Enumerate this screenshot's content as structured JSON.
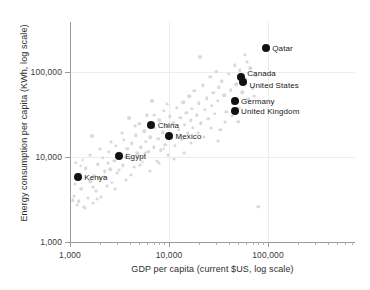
{
  "chart_data": {
    "type": "scatter",
    "title": "",
    "xlabel": "GDP per capita (current $US, log scale)",
    "ylabel": "Energy consumption per capita (KWh, log scale)",
    "xscale": "log",
    "yscale": "log",
    "xlim": [
      1000,
      400000
    ],
    "ylim": [
      1000,
      300000
    ],
    "grid": true,
    "legend": "none",
    "xticks": [
      {
        "value": 1000,
        "label": "1,000"
      },
      {
        "value": 10000,
        "label": "10,000"
      },
      {
        "value": 100000,
        "label": "100,000"
      }
    ],
    "yticks": [
      {
        "value": 1000,
        "label": "1,000"
      },
      {
        "value": 10000,
        "label": "10,000"
      },
      {
        "value": 100000,
        "label": "100,000"
      }
    ],
    "series": [
      {
        "name": "Highlighted countries",
        "color": "#111111",
        "points": [
          {
            "label": "Kenya",
            "x": 1200,
            "y": 5800,
            "label_pos": "right"
          },
          {
            "label": "Egypt",
            "x": 3100,
            "y": 10200,
            "label_pos": "right"
          },
          {
            "label": "China",
            "x": 6600,
            "y": 24000,
            "label_pos": "right"
          },
          {
            "label": "Mexico",
            "x": 10000,
            "y": 17500,
            "label_pos": "right"
          },
          {
            "label": "Canada",
            "x": 53000,
            "y": 88000,
            "label_pos": "right-stacked-top"
          },
          {
            "label": "United States",
            "x": 56000,
            "y": 76000,
            "label_pos": "right-stacked-bottom"
          },
          {
            "label": "Germany",
            "x": 46000,
            "y": 45000,
            "label_pos": "right"
          },
          {
            "label": "United Kingdom",
            "x": 46000,
            "y": 35000,
            "label_pos": "right"
          },
          {
            "label": "Qatar",
            "x": 95000,
            "y": 190000,
            "label_pos": "right"
          }
        ]
      },
      {
        "name": "Other countries",
        "color": "#d9d9d9",
        "points": [
          {
            "x": 1060,
            "y": 3100,
            "size": 3
          },
          {
            "x": 1090,
            "y": 3500,
            "size": 2.5
          },
          {
            "x": 1150,
            "y": 8600,
            "size": 3
          },
          {
            "x": 1180,
            "y": 2700,
            "size": 2.5
          },
          {
            "x": 1220,
            "y": 3000,
            "size": 3
          },
          {
            "x": 1260,
            "y": 6300,
            "size": 2.5
          },
          {
            "x": 1300,
            "y": 4200,
            "size": 3
          },
          {
            "x": 1340,
            "y": 9200,
            "size": 2.5
          },
          {
            "x": 1380,
            "y": 2600,
            "size": 3
          },
          {
            "x": 1450,
            "y": 7400,
            "size": 3
          },
          {
            "x": 1520,
            "y": 3300,
            "size": 2.5
          },
          {
            "x": 1600,
            "y": 5200,
            "size": 3
          },
          {
            "x": 1660,
            "y": 17500,
            "size": 3.5
          },
          {
            "x": 1700,
            "y": 2900,
            "size": 2.5
          },
          {
            "x": 1760,
            "y": 6000,
            "size": 3
          },
          {
            "x": 1820,
            "y": 4000,
            "size": 2.5
          },
          {
            "x": 1900,
            "y": 8200,
            "size": 3
          },
          {
            "x": 1980,
            "y": 5600,
            "size": 3
          },
          {
            "x": 2050,
            "y": 3400,
            "size": 2.5
          },
          {
            "x": 2150,
            "y": 9800,
            "size": 3
          },
          {
            "x": 2250,
            "y": 6800,
            "size": 3
          },
          {
            "x": 2350,
            "y": 4600,
            "size": 2.5
          },
          {
            "x": 2450,
            "y": 11500,
            "size": 3
          },
          {
            "x": 2550,
            "y": 7200,
            "size": 3
          },
          {
            "x": 2650,
            "y": 5000,
            "size": 2.5
          },
          {
            "x": 2800,
            "y": 9000,
            "size": 3
          },
          {
            "x": 2900,
            "y": 13500,
            "size": 3
          },
          {
            "x": 3000,
            "y": 6500,
            "size": 2.5
          },
          {
            "x": 3200,
            "y": 11000,
            "size": 3
          },
          {
            "x": 3400,
            "y": 8000,
            "size": 3
          },
          {
            "x": 3500,
            "y": 16000,
            "size": 3
          },
          {
            "x": 3650,
            "y": 5400,
            "size": 2.5
          },
          {
            "x": 3800,
            "y": 12500,
            "size": 3
          },
          {
            "x": 3900,
            "y": 29000,
            "size": 3.5
          },
          {
            "x": 4000,
            "y": 9500,
            "size": 3
          },
          {
            "x": 4200,
            "y": 14500,
            "size": 3
          },
          {
            "x": 4400,
            "y": 7600,
            "size": 2.5
          },
          {
            "x": 4600,
            "y": 18000,
            "size": 3
          },
          {
            "x": 4800,
            "y": 11000,
            "size": 3
          },
          {
            "x": 5000,
            "y": 24500,
            "size": 3
          },
          {
            "x": 5200,
            "y": 13000,
            "size": 3
          },
          {
            "x": 5400,
            "y": 8800,
            "size": 2.5
          },
          {
            "x": 5600,
            "y": 20000,
            "size": 3
          },
          {
            "x": 5800,
            "y": 15000,
            "size": 3
          },
          {
            "x": 6000,
            "y": 31000,
            "size": 3
          },
          {
            "x": 6200,
            "y": 11500,
            "size": 3
          },
          {
            "x": 6500,
            "y": 17000,
            "size": 3
          },
          {
            "x": 6800,
            "y": 45000,
            "size": 3.5
          },
          {
            "x": 7000,
            "y": 13000,
            "size": 3
          },
          {
            "x": 7200,
            "y": 22000,
            "size": 3
          },
          {
            "x": 7500,
            "y": 9000,
            "size": 2.5
          },
          {
            "x": 7800,
            "y": 16500,
            "size": 3
          },
          {
            "x": 8000,
            "y": 27000,
            "size": 3
          },
          {
            "x": 8300,
            "y": 12000,
            "size": 3
          },
          {
            "x": 8600,
            "y": 19500,
            "size": 3
          },
          {
            "x": 8900,
            "y": 35000,
            "size": 3
          },
          {
            "x": 9200,
            "y": 14000,
            "size": 3
          },
          {
            "x": 9500,
            "y": 23000,
            "size": 3
          },
          {
            "x": 9800,
            "y": 10500,
            "size": 2.5
          },
          {
            "x": 10200,
            "y": 30000,
            "size": 3
          },
          {
            "x": 10600,
            "y": 17000,
            "size": 3
          },
          {
            "x": 11000,
            "y": 25000,
            "size": 3
          },
          {
            "x": 11500,
            "y": 13500,
            "size": 3
          },
          {
            "x": 12000,
            "y": 38000,
            "size": 3
          },
          {
            "x": 12500,
            "y": 21000,
            "size": 3
          },
          {
            "x": 13000,
            "y": 29000,
            "size": 3
          },
          {
            "x": 13500,
            "y": 16000,
            "size": 3
          },
          {
            "x": 14000,
            "y": 44000,
            "size": 3
          },
          {
            "x": 14500,
            "y": 24000,
            "size": 3
          },
          {
            "x": 15000,
            "y": 33000,
            "size": 3
          },
          {
            "x": 15500,
            "y": 19000,
            "size": 3
          },
          {
            "x": 16000,
            "y": 52000,
            "size": 3
          },
          {
            "x": 16500,
            "y": 27000,
            "size": 3
          },
          {
            "x": 17000,
            "y": 37000,
            "size": 3
          },
          {
            "x": 17500,
            "y": 22000,
            "size": 3
          },
          {
            "x": 18000,
            "y": 60000,
            "size": 3
          },
          {
            "x": 19000,
            "y": 31000,
            "size": 3
          },
          {
            "x": 20000,
            "y": 43000,
            "size": 3
          },
          {
            "x": 20500,
            "y": 150000,
            "size": 3.5
          },
          {
            "x": 21000,
            "y": 25000,
            "size": 3
          },
          {
            "x": 22000,
            "y": 70000,
            "size": 3
          },
          {
            "x": 23000,
            "y": 36000,
            "size": 3
          },
          {
            "x": 24000,
            "y": 49000,
            "size": 3
          },
          {
            "x": 25000,
            "y": 28000,
            "size": 3
          },
          {
            "x": 26000,
            "y": 88000,
            "size": 3
          },
          {
            "x": 27000,
            "y": 40000,
            "size": 3
          },
          {
            "x": 28000,
            "y": 57000,
            "size": 3
          },
          {
            "x": 29000,
            "y": 32000,
            "size": 3
          },
          {
            "x": 30000,
            "y": 100000,
            "size": 3
          },
          {
            "x": 31000,
            "y": 46000,
            "size": 3
          },
          {
            "x": 32000,
            "y": 66000,
            "size": 3
          },
          {
            "x": 33000,
            "y": 21000,
            "size": 3
          },
          {
            "x": 34000,
            "y": 78000,
            "size": 3
          },
          {
            "x": 36000,
            "y": 53000,
            "size": 3
          },
          {
            "x": 38000,
            "y": 34000,
            "size": 3
          },
          {
            "x": 40000,
            "y": 95000,
            "size": 3
          },
          {
            "x": 42000,
            "y": 61000,
            "size": 3
          },
          {
            "x": 44000,
            "y": 42000,
            "size": 3
          },
          {
            "x": 46000,
            "y": 120000,
            "size": 3
          },
          {
            "x": 48000,
            "y": 72000,
            "size": 3
          },
          {
            "x": 50000,
            "y": 26000,
            "size": 3
          },
          {
            "x": 52000,
            "y": 105000,
            "size": 3
          },
          {
            "x": 55000,
            "y": 58000,
            "size": 3
          },
          {
            "x": 58000,
            "y": 160000,
            "size": 3
          },
          {
            "x": 60000,
            "y": 83000,
            "size": 3
          },
          {
            "x": 63000,
            "y": 48000,
            "size": 3
          },
          {
            "x": 66000,
            "y": 110000,
            "size": 3
          },
          {
            "x": 70000,
            "y": 64000,
            "size": 3
          },
          {
            "x": 75000,
            "y": 90000,
            "size": 3
          },
          {
            "x": 80000,
            "y": 2600,
            "size": 3
          },
          {
            "x": 1120,
            "y": 4800,
            "size": 2.5
          },
          {
            "x": 1280,
            "y": 7800,
            "size": 2.5
          },
          {
            "x": 1420,
            "y": 2500,
            "size": 2.5
          },
          {
            "x": 1580,
            "y": 10500,
            "size": 2.5
          },
          {
            "x": 1720,
            "y": 4400,
            "size": 2.5
          },
          {
            "x": 1870,
            "y": 3200,
            "size": 2.5
          },
          {
            "x": 2020,
            "y": 12500,
            "size": 2.5
          },
          {
            "x": 2200,
            "y": 5800,
            "size": 2.5
          },
          {
            "x": 2400,
            "y": 8400,
            "size": 2.5
          },
          {
            "x": 2600,
            "y": 15000,
            "size": 2.5
          },
          {
            "x": 2850,
            "y": 4200,
            "size": 2.5
          },
          {
            "x": 3100,
            "y": 7000,
            "size": 2.5
          },
          {
            "x": 3350,
            "y": 19000,
            "size": 2.5
          },
          {
            "x": 3600,
            "y": 10000,
            "size": 2.5
          },
          {
            "x": 4100,
            "y": 6200,
            "size": 2.5
          },
          {
            "x": 4500,
            "y": 23000,
            "size": 2.5
          },
          {
            "x": 5100,
            "y": 8000,
            "size": 2.5
          },
          {
            "x": 5700,
            "y": 11000,
            "size": 2.5
          },
          {
            "x": 6400,
            "y": 6800,
            "size": 2.5
          },
          {
            "x": 7100,
            "y": 31000,
            "size": 2.5
          },
          {
            "x": 7900,
            "y": 8500,
            "size": 2.5
          },
          {
            "x": 8800,
            "y": 12500,
            "size": 2.5
          },
          {
            "x": 9600,
            "y": 42000,
            "size": 2.5
          },
          {
            "x": 11200,
            "y": 9500,
            "size": 2.5
          },
          {
            "x": 12800,
            "y": 18000,
            "size": 2.5
          },
          {
            "x": 14200,
            "y": 11000,
            "size": 2.5
          },
          {
            "x": 16800,
            "y": 14500,
            "size": 2.5
          },
          {
            "x": 19500,
            "y": 19000,
            "size": 2.5
          },
          {
            "x": 22500,
            "y": 17000,
            "size": 2.5
          },
          {
            "x": 26500,
            "y": 22000,
            "size": 2.5
          },
          {
            "x": 31500,
            "y": 15500,
            "size": 2.5
          },
          {
            "x": 37000,
            "y": 26000,
            "size": 2.5
          },
          {
            "x": 43000,
            "y": 30000,
            "size": 2.5
          },
          {
            "x": 51000,
            "y": 38000,
            "size": 2.5
          },
          {
            "x": 62000,
            "y": 130000,
            "size": 2.5
          },
          {
            "x": 72000,
            "y": 52000,
            "size": 2.5
          }
        ]
      }
    ]
  }
}
